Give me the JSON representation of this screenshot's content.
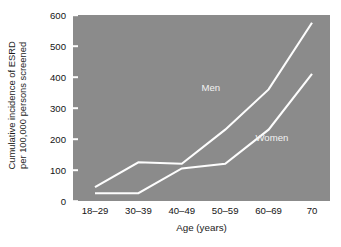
{
  "chart_data": {
    "type": "line",
    "title": "",
    "xlabel": "Age (years)",
    "ylabel": "Cumulative incidence of ESRD per 100,000 persons screened",
    "ylabel_line1": "Cumulative incidence of ESRD",
    "ylabel_line2": "per 100,000 persons screened",
    "categories": [
      "18–29",
      "30–39",
      "40–49",
      "50–59",
      "60–69",
      "70"
    ],
    "ylim": [
      0,
      600
    ],
    "yticks": [
      0,
      100,
      200,
      300,
      400,
      500,
      600
    ],
    "ytick_labels": [
      "0",
      "100",
      "200",
      "300",
      "400",
      "500",
      "600"
    ],
    "grid": false,
    "legend_position": "inline-on-plot",
    "series": [
      {
        "name": "Men",
        "values": [
          45,
          125,
          120,
          230,
          360,
          575
        ],
        "color": "#fdfdfd",
        "label_x_pct": 50,
        "label_y_pct": 36
      },
      {
        "name": "Women",
        "values": [
          25,
          25,
          105,
          120,
          230,
          410
        ],
        "color": "#fdfdfd",
        "label_x_pct": 71,
        "label_y_pct": 63
      }
    ],
    "plot_background": "#8b8b8b",
    "page_background": "#ffffff",
    "text_color": "#141414",
    "line_color": "#fdfdfd"
  }
}
